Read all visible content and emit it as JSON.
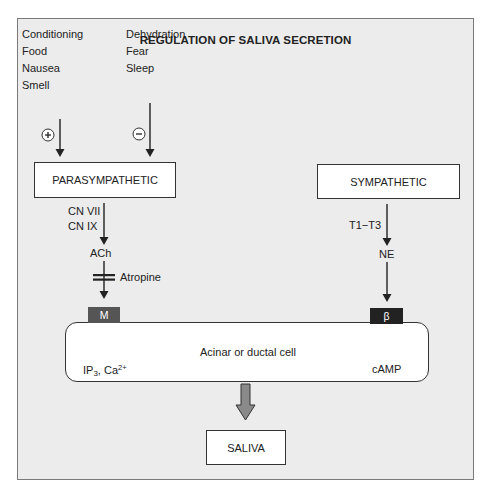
{
  "diagram": {
    "title": "REGULATION OF SALIVA SECRETION",
    "stimulators": [
      "Conditioning",
      "Food",
      "Nausea",
      "Smell"
    ],
    "inhibitors": [
      "Dehydration",
      "Fear",
      "Sleep"
    ],
    "stimulate_sign": "+",
    "inhibit_sign": "−",
    "parasympathetic": {
      "label": "PARASYMPATHETIC",
      "nerves": [
        "CN VII",
        "CN IX"
      ],
      "neurotransmitter": "ACh",
      "blocker": "Atropine",
      "receptor": "M",
      "second_messenger": {
        "base": "IP",
        "sub": "3",
        "mid": ", Ca",
        "sup": "2+"
      }
    },
    "sympathetic": {
      "label": "SYMPATHETIC",
      "nerves": "T1−T3",
      "neurotransmitter": "NE",
      "receptor": "β",
      "second_messenger": "cAMP"
    },
    "cell_label": "Acinar or ductal cell",
    "output_label": "SALIVA",
    "colors": {
      "background": "#ececec",
      "frame_border": "#7a7a7a",
      "m_receptor": "#555555",
      "beta_receptor": "#222222",
      "big_arrow": "#8a8a8a"
    }
  }
}
